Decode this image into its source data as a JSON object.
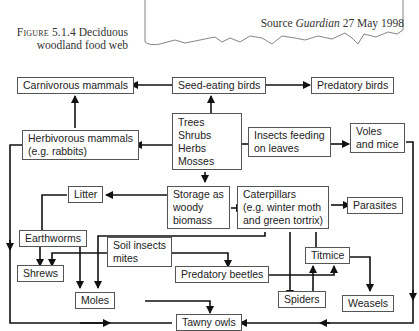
{
  "caption": {
    "figure_label": "Figure 5.1.4",
    "title_line1": "Deciduous",
    "title_line2": "woodland food web"
  },
  "source_box": {
    "prefix": "Source ",
    "publication": "Guardian",
    "date": " 27 May 1998"
  },
  "nodes": {
    "carnivorous_mammals": "Carnivorous mammals",
    "seed_eating_birds": "Seed-eating birds",
    "predatory_birds": "Predatory birds",
    "producers": [
      "Trees",
      "Shrubs",
      "Herbs",
      "Mosses"
    ],
    "herbivorous_mammals": [
      "Herbivorous mammals",
      "(e.g. rabbits)"
    ],
    "insects_feeding": [
      "Insects feeding",
      "on leaves"
    ],
    "voles_mice": [
      "Voles",
      "and mice"
    ],
    "litter": "Litter",
    "storage": [
      "Storage as",
      "woody",
      "biomass"
    ],
    "caterpillars": [
      "Caterpillars",
      "(e.g. winter moth",
      "and green tortrix)"
    ],
    "parasites": "Parasites",
    "earthworms": "Earthworms",
    "soil_insects": [
      "Soil insects",
      "mites"
    ],
    "shrews": "Shrews",
    "titmice": "Titmice",
    "predatory_beetles": "Predatory beetles",
    "moles": "Moles",
    "spiders": "Spiders",
    "weasels": "Weasels",
    "tawny_owls": "Tawny owls"
  },
  "edges": [
    [
      "Seed-eating birds",
      "Carnivorous mammals"
    ],
    [
      "Seed-eating birds",
      "Predatory birds"
    ],
    [
      "Trees/Shrubs/Herbs/Mosses",
      "Seed-eating birds"
    ],
    [
      "Trees/Shrubs/Herbs/Mosses",
      "Herbivorous mammals"
    ],
    [
      "Trees/Shrubs/Herbs/Mosses",
      "Insects feeding on leaves"
    ],
    [
      "Trees/Shrubs/Herbs/Mosses",
      "Storage as woody biomass"
    ],
    [
      "Herbivorous mammals",
      "Carnivorous mammals"
    ],
    [
      "Herbivorous mammals",
      "Tawny owls"
    ],
    [
      "Insects feeding on leaves",
      "Voles and mice"
    ],
    [
      "Voles and mice",
      "Tawny owls"
    ],
    [
      "Storage as woody biomass",
      "Litter"
    ],
    [
      "Storage as woody biomass",
      "Caterpillars"
    ],
    [
      "Litter",
      "Earthworms"
    ],
    [
      "Caterpillars",
      "Parasites"
    ],
    [
      "Caterpillars",
      "Titmice"
    ],
    [
      "Caterpillars",
      "Spiders"
    ],
    [
      "Caterpillars",
      "Moles"
    ],
    [
      "Earthworms",
      "Shrews"
    ],
    [
      "Earthworms",
      "Moles"
    ],
    [
      "Soil insects mites",
      "Shrews"
    ],
    [
      "Soil insects mites",
      "Predatory beetles"
    ],
    [
      "Predatory beetles",
      "Titmice"
    ],
    [
      "Spiders",
      "Titmice"
    ],
    [
      "Titmice",
      "Weasels"
    ],
    [
      "Moles",
      "Tawny owls"
    ]
  ]
}
